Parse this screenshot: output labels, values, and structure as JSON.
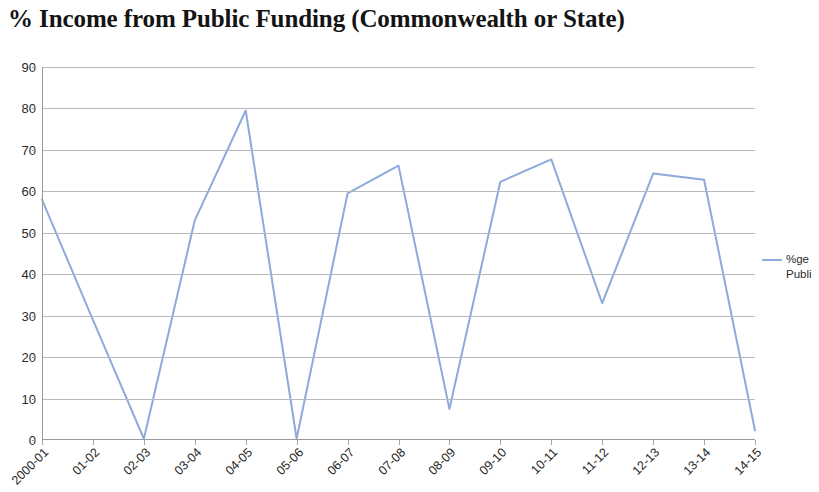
{
  "chart_data": {
    "type": "line",
    "title": "% Income from Public Funding (Commonwealth or State)",
    "xlabel": "",
    "ylabel": "",
    "ylim": [
      0,
      90
    ],
    "ytick_step": 10,
    "yticks": [
      "90",
      "80",
      "70",
      "60",
      "50",
      "40",
      "30",
      "20",
      "10",
      "0"
    ],
    "grid": true,
    "legend_position": "right",
    "categories": [
      "2000-01",
      "01-02",
      "02-03",
      "03-04",
      "04-05",
      "05-06",
      "06-07",
      "07-08",
      "08-09",
      "09-10",
      "10-11",
      "11-12",
      "12-13",
      "13-14",
      "14-15"
    ],
    "series": [
      {
        "name": "%ge Public",
        "legend_line_1": "%ge",
        "legend_line_2": "Publi",
        "color": "#8eaadb",
        "values": [
          58,
          29,
          0.3,
          53,
          79.5,
          0.3,
          59.5,
          66.2,
          7.5,
          62.3,
          67.7,
          33,
          64.3,
          62.8,
          2.3
        ]
      }
    ]
  },
  "colors": {
    "series": "#8eaadb",
    "gridline": "#b9b9b9",
    "axis": "#9a9a9a",
    "text": "#2b2b2b",
    "title": "#141414",
    "background": "#ffffff"
  }
}
